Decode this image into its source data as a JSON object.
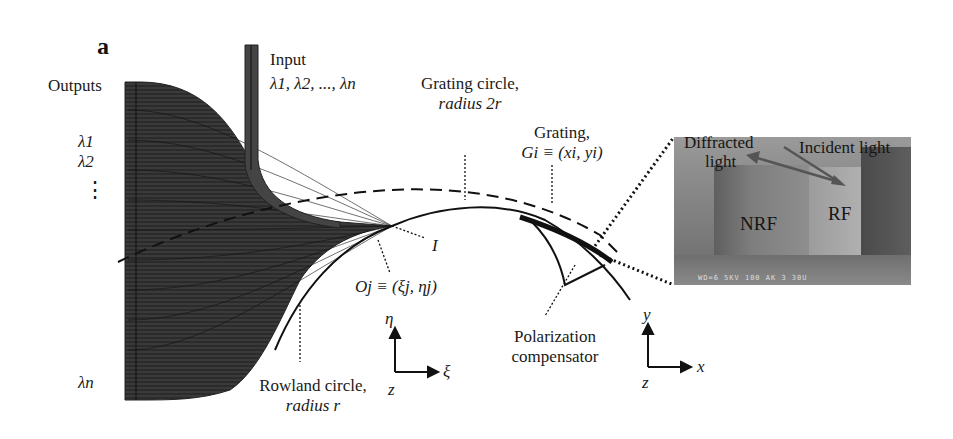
{
  "figure": {
    "panel_label": "a",
    "labels": {
      "outputs": "Outputs",
      "input_title": "Input",
      "input_wavelengths": "λ1, λ2, ..., λn",
      "output_lambda_1": "λ1",
      "output_lambda_2": "λ2",
      "output_ellipsis": "⋮",
      "output_lambda_n": "λn",
      "grating_circle_line1": "Grating circle,",
      "grating_circle_line2": "radius 2r",
      "grating_line1": "Grating,",
      "grating_line2": "Gi ≡ (xi, yi)",
      "point_I": "I",
      "point_Oj": "Oj ≡ (ξj, ηj)",
      "rowland_line1": "Rowland circle,",
      "rowland_line2": "radius r",
      "polarization_line1": "Polarization",
      "polarization_line2": "compensator"
    },
    "axes_local": {
      "vertical": "η",
      "horizontal": "ξ",
      "origin": "z"
    },
    "axes_global": {
      "vertical": "y",
      "horizontal": "x",
      "origin": "z"
    },
    "sem_inset": {
      "diffracted": "Diffracted",
      "light": "light",
      "incident": "Incident light",
      "nrf": "NRF",
      "rf": "RF",
      "scale_text": "WD=6 5KV 100  AK 3 30U"
    },
    "colors": {
      "waveguide_fill": "#333333",
      "line": "#111111",
      "sem_gray": "#8a8a8a"
    }
  }
}
